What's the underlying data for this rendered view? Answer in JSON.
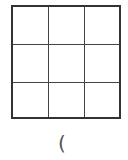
{
  "grid": {
    "rows": 3,
    "columns": 3,
    "border_color": "#333333",
    "line_color": "#444444",
    "cells": [
      [
        "",
        "",
        ""
      ],
      [
        "",
        "",
        ""
      ],
      [
        "",
        "",
        ""
      ]
    ]
  },
  "caption": {
    "text": "("
  }
}
